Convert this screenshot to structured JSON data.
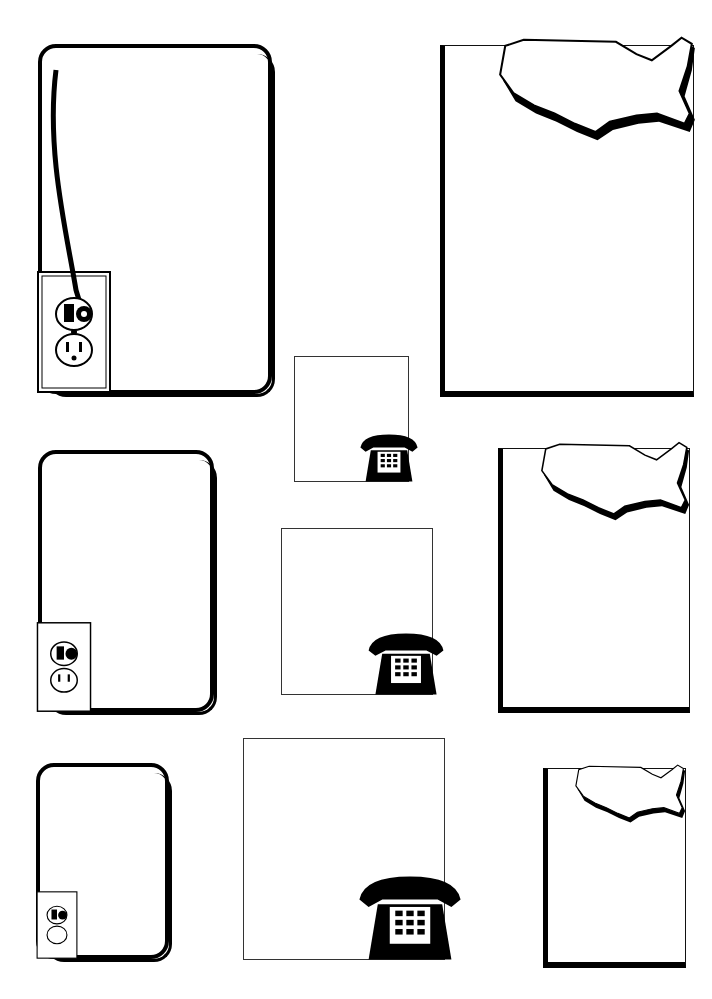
{
  "sheet": {
    "description": "Clip art sheet of blank frames",
    "frame_styles": {
      "outlet": "rounded frame with cord plugged into wall outlet",
      "phone": "square frame with push-button desk telephone",
      "map": "3D panel with United States map"
    }
  },
  "frames": [
    {
      "type": "outlet",
      "size": "large"
    },
    {
      "type": "map",
      "size": "large"
    },
    {
      "type": "phone",
      "size": "small"
    },
    {
      "type": "outlet",
      "size": "medium"
    },
    {
      "type": "map",
      "size": "medium"
    },
    {
      "type": "phone",
      "size": "medium"
    },
    {
      "type": "outlet",
      "size": "small"
    },
    {
      "type": "phone",
      "size": "large"
    },
    {
      "type": "map",
      "size": "small"
    }
  ]
}
